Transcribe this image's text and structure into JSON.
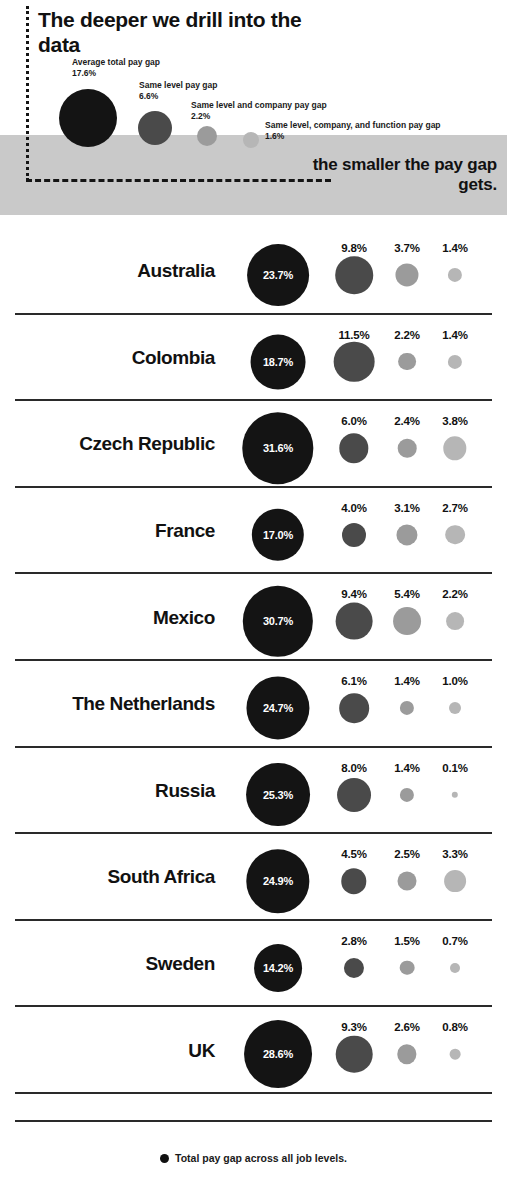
{
  "header": {
    "headline": "The deeper we drill into the data",
    "tagline": "the smaller the pay gap gets.",
    "legend_items": [
      {
        "label": "Average total pay gap",
        "value": "17.6%",
        "color": "#141414"
      },
      {
        "label": "Same level pay gap",
        "value": "6.6%",
        "color": "#4a4a4a"
      },
      {
        "label": "Same level and company pay gap",
        "value": "2.2%",
        "color": "#9b9b9b"
      },
      {
        "label": "Same level, company, and function pay gap",
        "value": "1.6%",
        "color": "#b6b6b6"
      }
    ],
    "banner_color": "#c9c9c9"
  },
  "footer": {
    "legend_label": "Total pay gap across all job levels.",
    "legend_dot_color": "#111111"
  },
  "chart_data": {
    "type": "bubble",
    "title": "The deeper we drill into the data the smaller the pay gap gets.",
    "xlabel": "",
    "ylabel": "",
    "grid": false,
    "legend_position": "top",
    "series": [
      {
        "name": "Average total pay gap",
        "color": "#141414"
      },
      {
        "name": "Same level pay gap",
        "color": "#4a4a4a"
      },
      {
        "name": "Same level and company pay gap",
        "color": "#9b9b9b"
      },
      {
        "name": "Same level, company, and function pay gap",
        "color": "#b6b6b6"
      }
    ],
    "categories": [
      "Australia",
      "Colombia",
      "Czech Republic",
      "France",
      "Mexico",
      "The Netherlands",
      "Russia",
      "South Africa",
      "Sweden",
      "UK"
    ],
    "rows": [
      {
        "country": "Australia",
        "values": [
          23.7,
          9.8,
          3.7,
          1.4
        ],
        "labels": [
          "23.7%",
          "9.8%",
          "3.7%",
          "1.4%"
        ]
      },
      {
        "country": "Colombia",
        "values": [
          18.7,
          11.5,
          2.2,
          1.4
        ],
        "labels": [
          "18.7%",
          "11.5%",
          "2.2%",
          "1.4%"
        ]
      },
      {
        "country": "Czech Republic",
        "values": [
          31.6,
          6.0,
          2.4,
          3.8
        ],
        "labels": [
          "31.6%",
          "6.0%",
          "2.4%",
          "3.8%"
        ]
      },
      {
        "country": "France",
        "values": [
          17.0,
          4.0,
          3.1,
          2.7
        ],
        "labels": [
          "17.0%",
          "4.0%",
          "3.1%",
          "2.7%"
        ]
      },
      {
        "country": "Mexico",
        "values": [
          30.7,
          9.4,
          5.4,
          2.2
        ],
        "labels": [
          "30.7%",
          "9.4%",
          "5.4%",
          "2.2%"
        ]
      },
      {
        "country": "The Netherlands",
        "values": [
          24.7,
          6.1,
          1.4,
          1.0
        ],
        "labels": [
          "24.7%",
          "6.1%",
          "1.4%",
          "1.0%"
        ]
      },
      {
        "country": "Russia",
        "values": [
          25.3,
          8.0,
          1.4,
          0.1
        ],
        "labels": [
          "25.3%",
          "8.0%",
          "1.4%",
          "0.1%"
        ]
      },
      {
        "country": "South Africa",
        "values": [
          24.9,
          4.5,
          2.5,
          3.3
        ],
        "labels": [
          "24.9%",
          "4.5%",
          "2.5%",
          "3.3%"
        ]
      },
      {
        "country": "Sweden",
        "values": [
          14.2,
          2.8,
          1.5,
          0.7
        ],
        "labels": [
          "14.2%",
          "2.8%",
          "1.5%",
          "0.7%"
        ]
      },
      {
        "country": "UK",
        "values": [
          28.6,
          9.3,
          2.6,
          0.8
        ],
        "labels": [
          "28.6%",
          "9.3%",
          "2.6%",
          "0.8%"
        ]
      }
    ]
  }
}
